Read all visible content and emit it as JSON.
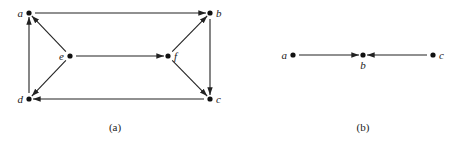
{
  "figure": {
    "graphs": [
      {
        "caption": "(a)",
        "nodes": [
          {
            "id": "a",
            "label": "a",
            "x": 29,
            "y": 13,
            "label_pos": "left"
          },
          {
            "id": "b",
            "label": "b",
            "x": 210,
            "y": 13,
            "label_pos": "right"
          },
          {
            "id": "c",
            "label": "c",
            "x": 210,
            "y": 99,
            "label_pos": "right"
          },
          {
            "id": "d",
            "label": "d",
            "x": 29,
            "y": 99,
            "label_pos": "left"
          },
          {
            "id": "e",
            "label": "e",
            "x": 70,
            "y": 56,
            "label_pos": "left"
          },
          {
            "id": "f",
            "label": "f",
            "x": 168,
            "y": 56,
            "label_pos": "right"
          }
        ],
        "edges": [
          {
            "from": "a",
            "to": "b"
          },
          {
            "from": "b",
            "to": "c"
          },
          {
            "from": "c",
            "to": "d"
          },
          {
            "from": "d",
            "to": "a"
          },
          {
            "from": "e",
            "to": "a"
          },
          {
            "from": "e",
            "to": "d"
          },
          {
            "from": "e",
            "to": "f"
          },
          {
            "from": "f",
            "to": "b"
          },
          {
            "from": "f",
            "to": "c"
          }
        ]
      },
      {
        "caption": "(b)",
        "nodes": [
          {
            "id": "a",
            "label": "a",
            "x": 293,
            "y": 55,
            "label_pos": "left"
          },
          {
            "id": "b",
            "label": "b",
            "x": 363,
            "y": 55,
            "label_pos": "below"
          },
          {
            "id": "c",
            "label": "c",
            "x": 433,
            "y": 55,
            "label_pos": "right"
          }
        ],
        "edges": [
          {
            "from": "a",
            "to": "b"
          },
          {
            "from": "c",
            "to": "b"
          }
        ]
      }
    ]
  }
}
